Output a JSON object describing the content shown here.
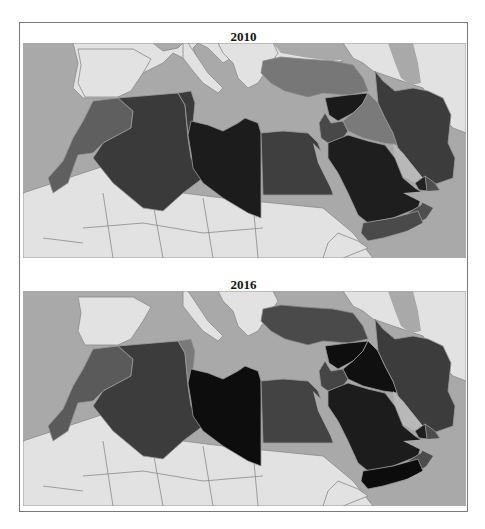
{
  "figure": {
    "panels": [
      {
        "title": "2010",
        "region": "Middle East and North Africa",
        "legend": null,
        "countries": {
          "Morocco": {
            "shade": 3,
            "color": "#5f5f5f"
          },
          "Western Sahara": {
            "shade": 3,
            "color": "#5f5f5f"
          },
          "Algeria": {
            "shade": 4,
            "color": "#3a3a3a"
          },
          "Tunisia": {
            "shade": 4,
            "color": "#3a3a3a"
          },
          "Libya": {
            "shade": 5,
            "color": "#1c1c1c"
          },
          "Egypt": {
            "shade": 4,
            "color": "#3f3f3f"
          },
          "Israel/Palestine": {
            "shade": 3,
            "color": "#5a5a5a"
          },
          "Jordan": {
            "shade": 4,
            "color": "#444444"
          },
          "Lebanon": {
            "shade": 4,
            "color": "#444444"
          },
          "Syria": {
            "shade": 5,
            "color": "#1a1a1a"
          },
          "Iraq": {
            "shade": 2,
            "color": "#7a7a7a"
          },
          "Turkey": {
            "shade": 2,
            "color": "#777777"
          },
          "Iran": {
            "shade": 4,
            "color": "#3c3c3c"
          },
          "Saudi Arabia": {
            "shade": 5,
            "color": "#1e1e1e"
          },
          "Kuwait": {
            "shade": 3,
            "color": "#555555"
          },
          "Qatar": {
            "shade": 4,
            "color": "#333333"
          },
          "UAE": {
            "shade": 5,
            "color": "#222222"
          },
          "Oman": {
            "shade": 3,
            "color": "#4f4f4f"
          },
          "Yemen": {
            "shade": 3,
            "color": "#4a4a4a"
          }
        }
      },
      {
        "title": "2016",
        "region": "Middle East and North Africa",
        "legend": null,
        "countries": {
          "Morocco": {
            "shade": 3,
            "color": "#5a5a5a"
          },
          "Western Sahara": {
            "shade": 3,
            "color": "#5a5a5a"
          },
          "Algeria": {
            "shade": 4,
            "color": "#3c3c3c"
          },
          "Tunisia": {
            "shade": 2,
            "color": "#7a7a7a"
          },
          "Libya": {
            "shade": 6,
            "color": "#0d0d0d"
          },
          "Egypt": {
            "shade": 4,
            "color": "#434343"
          },
          "Israel/Palestine": {
            "shade": 3,
            "color": "#555555"
          },
          "Jordan": {
            "shade": 4,
            "color": "#444444"
          },
          "Lebanon": {
            "shade": 4,
            "color": "#444444"
          },
          "Syria": {
            "shade": 6,
            "color": "#0e0e0e"
          },
          "Iraq": {
            "shade": 6,
            "color": "#101010"
          },
          "Turkey": {
            "shade": 4,
            "color": "#4a4a4a"
          },
          "Iran": {
            "shade": 4,
            "color": "#3c3c3c"
          },
          "Saudi Arabia": {
            "shade": 5,
            "color": "#1c1c1c"
          },
          "Kuwait": {
            "shade": 3,
            "color": "#4f4f4f"
          },
          "Qatar": {
            "shade": 5,
            "color": "#222222"
          },
          "UAE": {
            "shade": 5,
            "color": "#1e1e1e"
          },
          "Oman": {
            "shade": 3,
            "color": "#4c4c4c"
          },
          "Yemen": {
            "shade": 6,
            "color": "#0c0c0c"
          }
        }
      }
    ],
    "colors": {
      "sea": "#a9a9a9",
      "other_land": "#e3e3e3",
      "border": "#8a8a8a",
      "frame": "#7a7a7a"
    }
  }
}
